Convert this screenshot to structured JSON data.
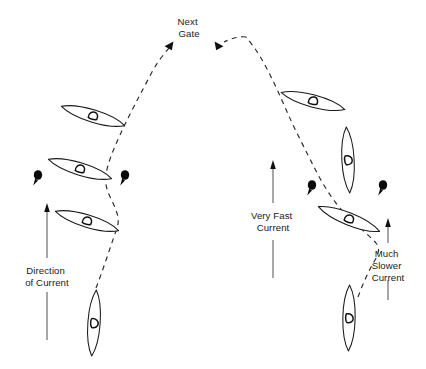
{
  "diagram": {
    "background_color": "#ffffff",
    "ink_color": "#1a1a1a",
    "labels": {
      "next_gate": {
        "line1": "Next",
        "line2": "Gate"
      },
      "direction_of_current": {
        "line1": "Direction",
        "line2": "of Current"
      },
      "very_fast_current": {
        "line1": "Very Fast",
        "line2": "Current"
      },
      "much_slower_current": {
        "line1": "Much",
        "line2": "Slower",
        "line3": "Current"
      }
    },
    "current_arrows": [
      {
        "name": "direction-of-current-arrow",
        "direction": "up",
        "label": "Direction of Current"
      },
      {
        "name": "very-fast-current-arrow",
        "direction": "up",
        "label": "Very Fast Current"
      },
      {
        "name": "much-slower-current-arrow",
        "direction": "up",
        "label": "Much Slower Current"
      }
    ],
    "gate_poles": [
      {
        "name": "gate-pole-left-outer",
        "side": "left"
      },
      {
        "name": "gate-pole-left-inner",
        "side": "left"
      },
      {
        "name": "gate-pole-right-inner",
        "side": "right"
      },
      {
        "name": "gate-pole-right-outer",
        "side": "right"
      }
    ],
    "kayaks": [
      {
        "name": "kayak-left-upper",
        "orientation": "tilted-down-right"
      },
      {
        "name": "kayak-left-middle",
        "orientation": "tilted-down-right"
      },
      {
        "name": "kayak-left-lower",
        "orientation": "tilted-down-right"
      },
      {
        "name": "kayak-left-bottom",
        "orientation": "vertical-upstream"
      },
      {
        "name": "kayak-right-upper",
        "orientation": "tilted-down-right"
      },
      {
        "name": "kayak-right-middle",
        "orientation": "vertical-upstream"
      },
      {
        "name": "kayak-right-lower",
        "orientation": "tilted-down-right"
      },
      {
        "name": "kayak-right-bottom",
        "orientation": "vertical-upstream"
      }
    ],
    "paths": [
      {
        "name": "left-kayak-track",
        "style": "dashed",
        "arrowhead": "to-next-gate"
      },
      {
        "name": "right-kayak-track",
        "style": "dashed",
        "arrowhead": "to-next-gate"
      }
    ]
  }
}
